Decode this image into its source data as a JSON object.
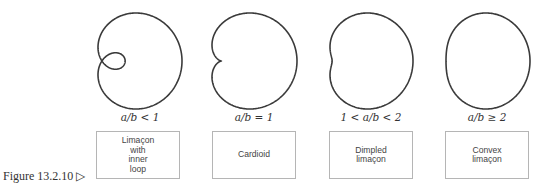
{
  "figure": {
    "caption": "Figure 13.2.10 ▷"
  },
  "chart_data": {
    "type": "diagram",
    "curves": [
      {
        "name": "Limaçon with inner loop",
        "condition": "a/b < 1",
        "cx": 140,
        "a": 1.0,
        "b": 0.35
      },
      {
        "name": "Cardioid",
        "condition": "a/b = 1",
        "cx": 254,
        "a": 1.0,
        "b": 1.0
      },
      {
        "name": "Dimpled limaçon",
        "condition": "1 < a/b < 2",
        "cx": 371,
        "a": 1.0,
        "b": 0.6
      },
      {
        "name": "Convex limaçon",
        "condition": "a/b ≥ 2",
        "cx": 487,
        "a": 1.0,
        "b": 0.35
      }
    ]
  },
  "panels": [
    {
      "condition": "a/b < 1",
      "label": "Limaçon\nwith\ninner\nloop"
    },
    {
      "condition": "a/b = 1",
      "label": "Cardioid"
    },
    {
      "condition": "1 < a/b < 2",
      "label": "Dimpled\nlimaçon"
    },
    {
      "condition": "a/b ≥ 2",
      "label": "Convex\nlimaçon"
    }
  ],
  "colors": {
    "stroke": "#3a3a3a",
    "box_border": "#b5b5b5",
    "text": "#333333"
  }
}
